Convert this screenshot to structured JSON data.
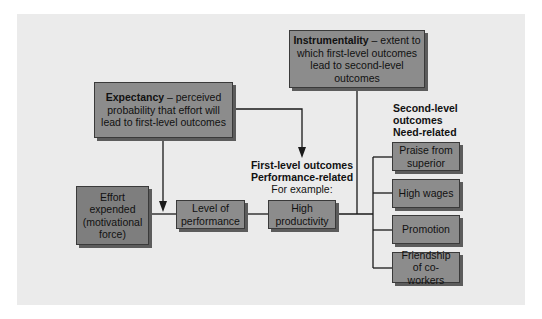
{
  "diagram": {
    "type": "expectancy-theory-flow",
    "expectancy": {
      "term": "Expectancy",
      "definition": "– perceived probability that effort will lead to first-level outcomes"
    },
    "instrumentality": {
      "term": "Instrumentality",
      "definition": "– extent to which first-level outcomes lead to second-level outcomes"
    },
    "effort": "Effort expended (motivational force)",
    "level_of_performance": "Level of performance",
    "first_level": {
      "title": "First-level outcomes",
      "subtitle": "Performance-related",
      "example_label": "For example:",
      "example": "High productivity"
    },
    "second_level": {
      "title": "Second-level outcomes",
      "subtitle": "Need-related",
      "items": [
        "Praise from superior",
        "High wages",
        "Promotion",
        "Friendship of co-workers"
      ]
    },
    "colors": {
      "panel": "#ebebeb",
      "box": "#8c8c8c",
      "box_dark": "#7e7e7e",
      "shadow": "#5c5c5c",
      "line": "#1a1a1a"
    }
  }
}
